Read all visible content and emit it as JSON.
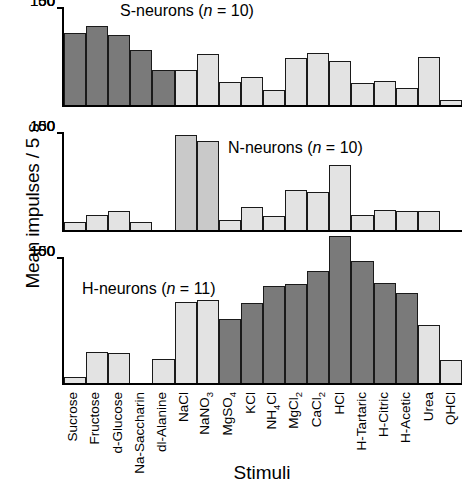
{
  "chart_data": {
    "type": "bar",
    "title": "",
    "xlabel": "Stimuli",
    "ylabel": "Mean impulses / 5 s",
    "ylim": [
      0,
      150
    ],
    "yticks": [
      0,
      50,
      100,
      150
    ],
    "grid": false,
    "legend": "none",
    "categories": [
      "Sucrose",
      "Fructose",
      "d-Glucose",
      "Na-Saccharin",
      "dl-Alanine",
      "NaCl",
      "NaNO3",
      "MgSO4",
      "KCl",
      "NH4Cl",
      "MgCl2",
      "CaCl2",
      "HCl",
      "H-Tartaric",
      "H-Citric",
      "H-Acetic",
      "Urea",
      "QHCl"
    ],
    "category_labels_html": [
      "Sucrose",
      "Fructose",
      "d-Glucose",
      "Na-Saccharin",
      "dl-Alanine",
      "NaCl",
      "NaNO<sub>3</sub>",
      "MgSO<sub>4</sub>",
      "KCl",
      "NH<sub>4</sub>Cl",
      "MgCl<sub>2</sub>",
      "CaCl<sub>2</sub>",
      "HCl",
      "H-Tartaric",
      "H-Citric",
      "H-Acetic",
      "Urea",
      "QHCl"
    ],
    "panels": [
      {
        "id": "s-neurons",
        "note_prefix": "S-neurons (",
        "note_italic": "n",
        "note_suffix": " = 10)",
        "values": [
          112,
          123,
          110,
          86,
          54,
          55,
          80,
          36,
          44,
          23,
          73,
          82,
          68,
          35,
          37,
          27,
          75,
          8
        ],
        "shades": [
          "dark",
          "dark",
          "dark",
          "dark",
          "dark",
          "light",
          "light",
          "light",
          "light",
          "light",
          "light",
          "light",
          "light",
          "light",
          "light",
          "light",
          "light",
          "light"
        ]
      },
      {
        "id": "n-neurons",
        "note_prefix": "N-neurons (",
        "note_italic": "n",
        "note_suffix": " = 10)",
        "values": [
          13,
          23,
          29,
          12,
          0,
          149,
          139,
          16,
          36,
          22,
          62,
          60,
          102,
          23,
          31,
          30,
          30,
          0
        ],
        "shades": [
          "light",
          "light",
          "light",
          "light",
          "light",
          "mid",
          "mid",
          "light",
          "light",
          "light",
          "light",
          "light",
          "light",
          "light",
          "light",
          "light",
          "light",
          "light"
        ]
      },
      {
        "id": "h-neurons",
        "note_prefix": "H-neurons (",
        "note_italic": "n",
        "note_suffix": " = 11)",
        "values": [
          7,
          37,
          36,
          0,
          29,
          98,
          101,
          77,
          97,
          117,
          120,
          136,
          178,
          148,
          121,
          109,
          70,
          28
        ],
        "shades": [
          "light",
          "light",
          "light",
          "light",
          "light",
          "light",
          "light",
          "dark",
          "dark",
          "dark",
          "dark",
          "dark",
          "dark",
          "dark",
          "dark",
          "dark",
          "light",
          "light"
        ]
      }
    ]
  }
}
